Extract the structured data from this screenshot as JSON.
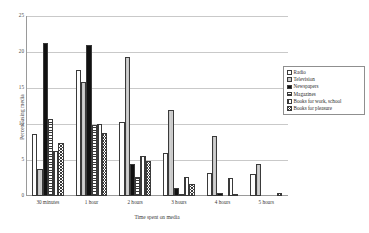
{
  "chart_data": {
    "type": "bar",
    "title": "",
    "xlabel": "Time spent on media",
    "ylabel": "Percent using media",
    "ylim": [
      0,
      25
    ],
    "yticks": [
      0,
      5,
      10,
      15,
      20,
      25
    ],
    "grid": true,
    "legend_position": "right",
    "categories": [
      "30 minutes",
      "1 hour",
      "2 hours",
      "3 hours",
      "4 hours",
      "5 hours"
    ],
    "series": [
      {
        "name": "Radio",
        "values": [
          8.6,
          17.5,
          10.3,
          6.0,
          3.2,
          3.0
        ]
      },
      {
        "name": "Television",
        "values": [
          3.8,
          15.9,
          19.3,
          12.0,
          8.4,
          4.4
        ]
      },
      {
        "name": "Newspapers",
        "values": [
          21.2,
          21.0,
          4.4,
          1.1,
          0.4,
          0.0
        ]
      },
      {
        "name": "Magazines",
        "values": [
          10.7,
          9.9,
          2.7,
          0.3,
          0.0,
          0.0
        ]
      },
      {
        "name": "Books for work, school",
        "values": [
          6.3,
          10.0,
          5.5,
          2.7,
          2.5,
          0.0
        ]
      },
      {
        "name": "Books for pleasure",
        "values": [
          7.3,
          8.8,
          4.9,
          1.7,
          0.2,
          0.4
        ]
      }
    ]
  },
  "axis": {
    "y_title": "Percent using media",
    "x_title": "Time spent on media",
    "y_ticks": [
      "0",
      "5",
      "10",
      "15",
      "20",
      "25"
    ],
    "x_ticks": [
      "30 minutes",
      "1 hour",
      "2 hours",
      "3 hours",
      "4 hours",
      "5 hours"
    ]
  },
  "legend": {
    "items": [
      {
        "label": "Radio"
      },
      {
        "label": "Television"
      },
      {
        "label": "Newspapers"
      },
      {
        "label": "Magazines"
      },
      {
        "label": "Books for work, school"
      },
      {
        "label": "Books for pleasure"
      }
    ]
  }
}
